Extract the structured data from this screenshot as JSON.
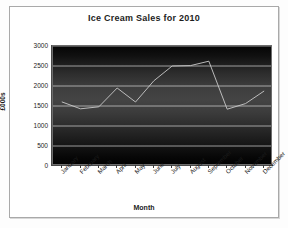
{
  "chart_data": {
    "type": "line",
    "title": "Ice Cream Sales for 2010",
    "xlabel": "Month",
    "ylabel": "£000s",
    "categories": [
      "January",
      "February",
      "March",
      "April",
      "May",
      "June",
      "July",
      "August",
      "September",
      "October",
      "November",
      "December"
    ],
    "values": [
      1600,
      1430,
      1480,
      1950,
      1600,
      2130,
      2500,
      2510,
      2620,
      1420,
      1560,
      1870
    ],
    "ylim": [
      0,
      3000
    ],
    "yticks": [
      0,
      500,
      1000,
      1500,
      2000,
      2500,
      3000
    ],
    "ytick_labels": [
      "0",
      "500",
      "1000",
      "1500",
      "2000",
      "2500",
      "3000"
    ],
    "grid": true,
    "legend": false,
    "series_color": "#c9c9c9",
    "plot_background": "#2e2e2e",
    "gridline_color": "#d5d5d5"
  }
}
